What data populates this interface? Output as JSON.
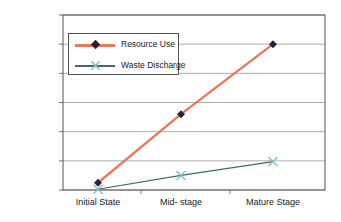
{
  "chart_data": {
    "type": "line",
    "title": "",
    "subtitle": "",
    "xlabel": "",
    "ylabel": "",
    "categories": [
      "Initial State",
      "Mid- stage",
      "Mature Stage"
    ],
    "series": [
      {
        "name": "Resource Use",
        "values": [
          50000,
          520000,
          1000000
        ],
        "color": "#E8795A",
        "marker": "diamond",
        "marker_color": "#2B2038"
      },
      {
        "name": "Waste Discharge",
        "values": [
          5000,
          100000,
          195000
        ],
        "color": "#3E6B6B",
        "marker": "x",
        "marker_color": "#7FC4C4"
      }
    ],
    "ylim": [
      0,
      1200000
    ],
    "yticks": [
      0,
      200000,
      400000,
      600000,
      800000,
      1000000,
      1200000
    ],
    "ytick_labels": [
      "0",
      "200000",
      "400000",
      "600000",
      "800000",
      "1000000",
      "1200000"
    ],
    "grid": true,
    "grid_axis": "y",
    "grid_color": "#9a9a9a",
    "legend_position": "upper-left-inside",
    "plot_border_color": "#55504e",
    "background": "#ffffff"
  },
  "legend": {
    "entries": [
      {
        "label": "Resource Use"
      },
      {
        "label": "Waste Discharge"
      }
    ]
  }
}
